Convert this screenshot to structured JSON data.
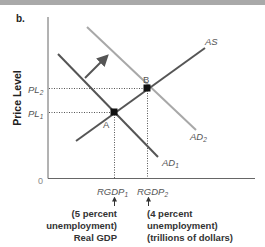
{
  "panel_label": "b.",
  "y_axis": {
    "title": "Price Level",
    "origin_label": "0",
    "ticks": [
      {
        "base": "PL",
        "sub": "2"
      },
      {
        "base": "PL",
        "sub": "1"
      }
    ]
  },
  "x_axis": {
    "ticks": [
      {
        "base": "RGDP",
        "sub": "1"
      },
      {
        "base": "RGDP",
        "sub": "2"
      }
    ],
    "notes": [
      {
        "lines": [
          "(5 percent",
          "unemployment)",
          "Real GDP"
        ]
      },
      {
        "lines": [
          "(4 percent",
          "unemployment)",
          "(trillions of dollars)"
        ]
      }
    ]
  },
  "curves": {
    "as": {
      "label": "AS",
      "color": "#555555"
    },
    "ad1": {
      "base": "AD",
      "sub": "1",
      "color": "#555555"
    },
    "ad2": {
      "base": "AD",
      "sub": "2",
      "color": "#a8a8a8"
    }
  },
  "points": {
    "a": {
      "label": "A"
    },
    "b": {
      "label": "B"
    }
  },
  "shift_arrow": {
    "meaning": "AD shifts right",
    "color": "#555555"
  },
  "colors": {
    "axis": "#666666",
    "guide": "#555555",
    "point": "#111111"
  }
}
